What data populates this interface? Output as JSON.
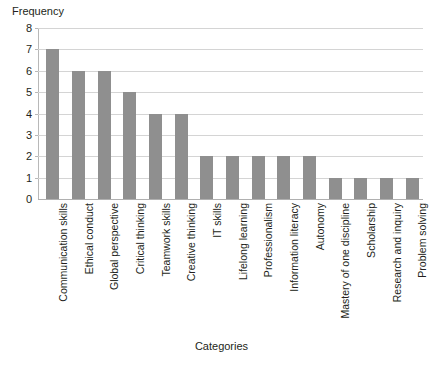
{
  "chart_data": {
    "type": "bar",
    "title": "",
    "xlabel": "Categories",
    "ylabel": "Frequency",
    "ylim": [
      0,
      8
    ],
    "ytick_labels": [
      "8",
      "7",
      "6",
      "5",
      "4",
      "3",
      "2",
      "1",
      "0"
    ],
    "yticks": [
      8,
      7,
      6,
      5,
      4,
      3,
      2,
      1,
      0
    ],
    "grid": true,
    "legend": "none",
    "orientation": "vertical",
    "bar_color": "#8f8f8f",
    "gridline_color": "#d4d4d4",
    "axis_color": "#b8b8b8",
    "background_color": "#ffffff",
    "categories": [
      "Communication skills",
      "Ethical conduct",
      "Global perspective",
      "Critical thinking",
      "Teamwork skills",
      "Creative thinking",
      "IT skills",
      "Lifelong learning",
      "Professionalism",
      "Information literacy",
      "Autonomy",
      "Mastery of one discipline",
      "Scholarship",
      "Research and inquiry",
      "Problem solving"
    ],
    "values": [
      7,
      6,
      6,
      5,
      4,
      4,
      2,
      2,
      2,
      2,
      2,
      1,
      1,
      1,
      1
    ]
  }
}
